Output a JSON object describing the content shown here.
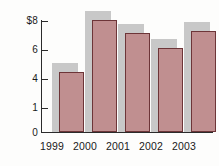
{
  "chart_data": {
    "type": "bar",
    "title": "",
    "xlabel": "",
    "ylabel": "",
    "categories": [
      "1999",
      "2000",
      "2001",
      "2002",
      "2003"
    ],
    "values": [
      4.3,
      8.0,
      7.1,
      6.0,
      7.2
    ],
    "ytick_labels": [
      "$8",
      "6",
      "4",
      "1",
      "0"
    ],
    "ytick_values": [
      8,
      6,
      4,
      1,
      0
    ],
    "ylim": [
      0,
      8
    ],
    "grid": false,
    "legend": null,
    "series": [
      {
        "name": "",
        "values": [
          4.3,
          8.0,
          7.1,
          6.0,
          7.2
        ]
      }
    ],
    "colors": {
      "bar_fill": "#c08f90",
      "bar_outline": "#6d3538",
      "bar_shadow": "#c3c3c3",
      "axis": "#2b2b2b",
      "text": "#1a1a1a",
      "background": "#fdfdfc"
    }
  }
}
